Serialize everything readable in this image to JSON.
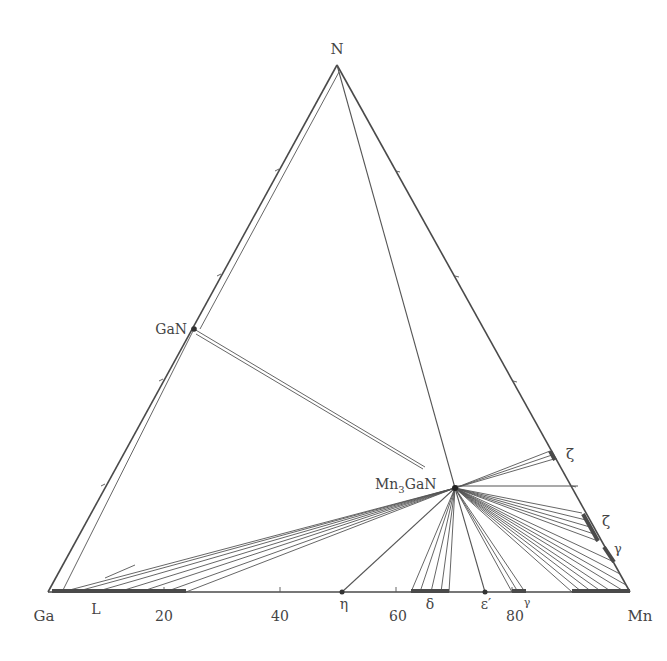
{
  "diagram": {
    "vertices": {
      "top": "N",
      "left": "Ga",
      "right": "Mn"
    },
    "axis": {
      "ticks": [
        {
          "value": 20,
          "label": "20"
        },
        {
          "value": 40,
          "label": "40"
        },
        {
          "value": 60,
          "label": "60"
        },
        {
          "value": 80,
          "label": "80"
        }
      ]
    },
    "compounds": {
      "gan": "GaN",
      "mn3gan_main": "Mn",
      "mn3gan_sub": "3",
      "mn3gan_tail": "GaN"
    },
    "phase_labels": {
      "liquid": "L",
      "eta": "η",
      "delta": "δ",
      "epsilon_prime": "ε′",
      "gamma_bottom": "γ",
      "zeta_upper": "ζ",
      "zeta_lower": "ζ",
      "gamma_right": "γ"
    },
    "colors": {
      "line": "#4a4a4a",
      "text": "#444444",
      "background": "#ffffff"
    }
  }
}
